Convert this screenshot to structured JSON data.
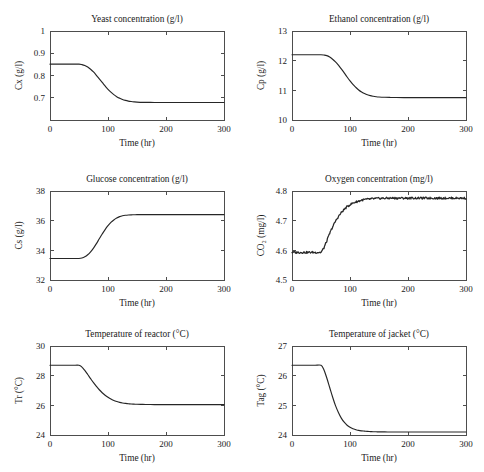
{
  "figure": {
    "name": "fermentation-process-simulation-panels",
    "layout": {
      "rows": 3,
      "cols": 2
    },
    "background_color": "#ffffff",
    "line_color": "#262626",
    "axis_color": "#4d4d4d"
  },
  "chart_data": [
    {
      "id": "yeast-concentration",
      "type": "line",
      "title": "Yeast concentration (g/l)",
      "xlabel": "Time (hr)",
      "ylabel": "Cx (g/l)",
      "xlim": [
        0,
        300
      ],
      "ylim": [
        0.6,
        1
      ],
      "xticks": [
        0,
        100,
        200,
        300
      ],
      "xticklabels": [
        "0",
        "100",
        "200",
        "300"
      ],
      "yticks": [
        0.7,
        0.8,
        0.9,
        1
      ],
      "yticklabels": [
        "0.7",
        "0.8",
        "0.9",
        "1"
      ],
      "grid": false,
      "legend": null,
      "noisy": false,
      "series": [
        {
          "name": "Cx",
          "x": [
            0,
            10,
            20,
            30,
            40,
            50,
            55,
            60,
            65,
            70,
            75,
            80,
            85,
            90,
            95,
            100,
            105,
            110,
            115,
            120,
            125,
            130,
            135,
            140,
            145,
            150,
            160,
            170,
            180,
            200,
            220,
            250,
            275,
            300
          ],
          "y": [
            0.851,
            0.851,
            0.851,
            0.851,
            0.851,
            0.851,
            0.849,
            0.845,
            0.838,
            0.828,
            0.816,
            0.801,
            0.785,
            0.769,
            0.753,
            0.738,
            0.725,
            0.714,
            0.705,
            0.698,
            0.692,
            0.688,
            0.685,
            0.683,
            0.6815,
            0.6805,
            0.6795,
            0.679,
            0.6788,
            0.6785,
            0.6785,
            0.6785,
            0.6785,
            0.6785
          ]
        }
      ]
    },
    {
      "id": "ethanol-concentration",
      "type": "line",
      "title": "Ethanol concentration (g/l)",
      "xlabel": "Time (hr)",
      "ylabel": "Cp (g/l)",
      "xlim": [
        0,
        300
      ],
      "ylim": [
        10,
        13
      ],
      "xticks": [
        0,
        100,
        200,
        300
      ],
      "xticklabels": [
        "0",
        "100",
        "200",
        "300"
      ],
      "yticks": [
        10,
        11,
        12,
        13
      ],
      "yticklabels": [
        "10",
        "11",
        "12",
        "13"
      ],
      "grid": false,
      "legend": null,
      "noisy": false,
      "series": [
        {
          "name": "Cp",
          "x": [
            0,
            10,
            20,
            30,
            40,
            50,
            55,
            60,
            65,
            70,
            75,
            80,
            85,
            90,
            95,
            100,
            105,
            110,
            115,
            120,
            125,
            130,
            135,
            140,
            145,
            150,
            160,
            170,
            180,
            200,
            220,
            250,
            275,
            300
          ],
          "y": [
            12.2,
            12.2,
            12.2,
            12.2,
            12.2,
            12.2,
            12.19,
            12.17,
            12.12,
            12.05,
            11.96,
            11.85,
            11.72,
            11.59,
            11.45,
            11.32,
            11.2,
            11.1,
            11.01,
            10.94,
            10.89,
            10.85,
            10.82,
            10.8,
            10.785,
            10.775,
            10.765,
            10.76,
            10.757,
            10.755,
            10.755,
            10.755,
            10.755,
            10.755
          ]
        }
      ]
    },
    {
      "id": "glucose-concentration",
      "type": "line",
      "title": "Glucose concentration (g/l)",
      "xlabel": "Time (hr)",
      "ylabel": "Cs (g/l)",
      "xlim": [
        0,
        300
      ],
      "ylim": [
        32,
        38
      ],
      "xticks": [
        0,
        100,
        200,
        300
      ],
      "xticklabels": [
        "0",
        "100",
        "200",
        "300"
      ],
      "yticks": [
        32,
        34,
        36,
        38
      ],
      "yticklabels": [
        "32",
        "34",
        "36",
        "38"
      ],
      "grid": false,
      "legend": null,
      "noisy": false,
      "series": [
        {
          "name": "Cs",
          "x": [
            0,
            10,
            20,
            30,
            40,
            50,
            55,
            60,
            65,
            70,
            75,
            80,
            85,
            90,
            95,
            100,
            105,
            110,
            115,
            120,
            125,
            130,
            135,
            140,
            145,
            150,
            160,
            170,
            180,
            200,
            220,
            250,
            275,
            300
          ],
          "y": [
            33.45,
            33.45,
            33.45,
            33.45,
            33.45,
            33.45,
            33.48,
            33.56,
            33.7,
            33.9,
            34.15,
            34.45,
            34.78,
            35.1,
            35.4,
            35.66,
            35.88,
            36.05,
            36.18,
            36.27,
            36.33,
            36.365,
            36.385,
            36.395,
            36.4,
            36.405,
            36.41,
            36.41,
            36.41,
            36.41,
            36.41,
            36.41,
            36.41,
            36.41
          ]
        }
      ]
    },
    {
      "id": "oxygen-concentration",
      "type": "line",
      "title": "Oxygen concentration (mg/l)",
      "xlabel": "Time (hr)",
      "ylabel": "CO₂ (mg/l)",
      "xlim": [
        0,
        300
      ],
      "ylim": [
        4.5,
        4.8
      ],
      "xticks": [
        0,
        100,
        200,
        300
      ],
      "xticklabels": [
        "0",
        "100",
        "200",
        "300"
      ],
      "yticks": [
        4.5,
        4.6,
        4.7,
        4.8
      ],
      "yticklabels": [
        "4.5",
        "4.6",
        "4.7",
        "4.8"
      ],
      "grid": false,
      "legend": null,
      "noisy": true,
      "noise_amplitude": 0.0035,
      "series": [
        {
          "name": "CO2",
          "x": [
            0,
            10,
            20,
            30,
            40,
            50,
            55,
            60,
            65,
            70,
            75,
            80,
            85,
            90,
            95,
            100,
            105,
            110,
            115,
            120,
            125,
            130,
            135,
            140,
            145,
            150,
            160,
            170,
            180,
            200,
            220,
            250,
            275,
            300
          ],
          "y": [
            4.593,
            4.593,
            4.593,
            4.593,
            4.593,
            4.593,
            4.608,
            4.632,
            4.657,
            4.679,
            4.698,
            4.714,
            4.727,
            4.738,
            4.747,
            4.754,
            4.759,
            4.763,
            4.766,
            4.769,
            4.771,
            4.772,
            4.773,
            4.774,
            4.7745,
            4.775,
            4.7755,
            4.776,
            4.776,
            4.776,
            4.776,
            4.776,
            4.776,
            4.776
          ]
        }
      ]
    },
    {
      "id": "reactor-temperature",
      "type": "line",
      "title": "Temperature of reactor (°C)",
      "xlabel": "Time (hr)",
      "ylabel": "Tr (°C)",
      "xlim": [
        0,
        300
      ],
      "ylim": [
        24,
        30
      ],
      "xticks": [
        0,
        100,
        200,
        300
      ],
      "xticklabels": [
        "0",
        "100",
        "200",
        "300"
      ],
      "yticks": [
        24,
        26,
        28,
        30
      ],
      "yticklabels": [
        "24",
        "26",
        "28",
        "30"
      ],
      "grid": false,
      "legend": null,
      "noisy": false,
      "series": [
        {
          "name": "Tr",
          "x": [
            0,
            10,
            20,
            30,
            40,
            50,
            55,
            60,
            65,
            70,
            75,
            80,
            85,
            90,
            95,
            100,
            105,
            110,
            115,
            120,
            125,
            130,
            135,
            140,
            145,
            150,
            160,
            170,
            180,
            200,
            220,
            250,
            275,
            300
          ],
          "y": [
            28.7,
            28.7,
            28.7,
            28.7,
            28.7,
            28.7,
            28.58,
            28.35,
            28.08,
            27.8,
            27.53,
            27.28,
            27.05,
            26.85,
            26.68,
            26.54,
            26.42,
            26.33,
            26.26,
            26.2,
            26.16,
            26.13,
            26.11,
            26.09,
            26.08,
            26.07,
            26.06,
            26.055,
            26.05,
            26.05,
            26.05,
            26.05,
            26.05,
            26.05
          ]
        }
      ]
    },
    {
      "id": "jacket-temperature",
      "type": "line",
      "title": "Temperature of jacket (°C)",
      "xlabel": "Time (hr)",
      "ylabel": "Tag (°C)",
      "xlim": [
        24,
        27
      ],
      "ylim": [
        24,
        27
      ],
      "xticks": [
        0,
        100,
        200,
        300
      ],
      "xticklabels": [
        "0",
        "100",
        "200",
        "300"
      ],
      "yticks": [
        24,
        25,
        26,
        27
      ],
      "yticklabels": [
        "24",
        "25",
        "26",
        "27"
      ],
      "grid": false,
      "legend": null,
      "noisy": false,
      "series": [
        {
          "name": "Tag",
          "x": [
            0,
            10,
            20,
            30,
            40,
            50,
            55,
            60,
            65,
            70,
            75,
            80,
            85,
            90,
            95,
            100,
            105,
            110,
            115,
            120,
            125,
            130,
            135,
            140,
            145,
            150,
            160,
            170,
            180,
            200,
            220,
            250,
            275,
            300
          ],
          "y": [
            26.35,
            26.35,
            26.35,
            26.35,
            26.35,
            26.35,
            26.2,
            25.92,
            25.6,
            25.28,
            24.99,
            24.76,
            24.57,
            24.43,
            24.33,
            24.26,
            24.21,
            24.18,
            24.155,
            24.14,
            24.13,
            24.12,
            24.115,
            24.11,
            24.108,
            24.105,
            24.103,
            24.102,
            24.1,
            24.1,
            24.1,
            24.1,
            24.1,
            24.1
          ]
        }
      ]
    }
  ]
}
